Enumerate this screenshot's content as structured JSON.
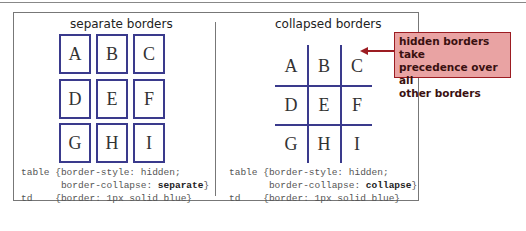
{
  "left_panel": {
    "title": "separate borders",
    "cells": [
      "A",
      "B",
      "C",
      "D",
      "E",
      "F",
      "G",
      "H",
      "I"
    ],
    "code": {
      "line1_selector": "table",
      "line1_rule": "{border-style: hidden;",
      "line2_prefix": "border-collapse: ",
      "line2_value": "separate",
      "line2_suffix": "}",
      "line3_selector": "td",
      "line3_rule": "{border: 1px solid blue}"
    }
  },
  "right_panel": {
    "title": "collapsed borders",
    "cells": [
      "A",
      "B",
      "C",
      "D",
      "E",
      "F",
      "G",
      "H",
      "I"
    ],
    "code": {
      "line1_selector": "table",
      "line1_rule": "{border-style: hidden;",
      "line2_prefix": "border-collapse: ",
      "line2_value": "collapse",
      "line2_suffix": "}",
      "line3_selector": "td",
      "line3_rule": "{border: 1px solid blue}"
    }
  },
  "callout": {
    "text_line1": "hidden borders take",
    "text_line2": "precedence over all",
    "text_line3": "other borders"
  },
  "colors": {
    "cell_border": "#3a3a8c",
    "callout_fill": "#e9a3a3",
    "callout_border": "#9c1c22"
  }
}
